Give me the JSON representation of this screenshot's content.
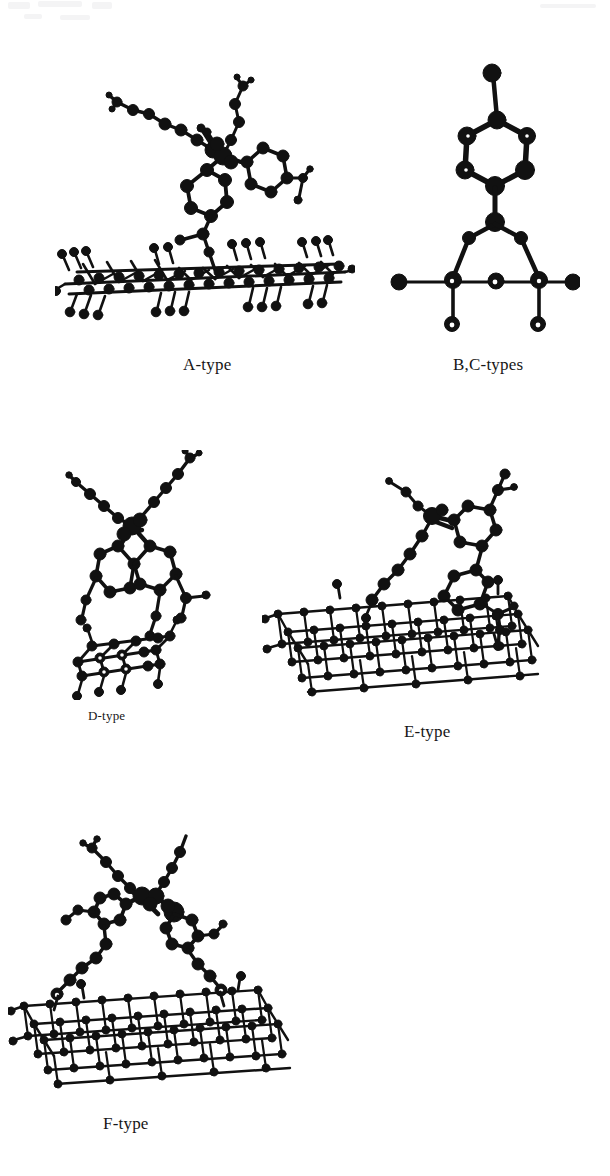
{
  "page": {
    "background": "#ffffff",
    "width": 610,
    "height": 1176,
    "kind": "scientific-figure-scan",
    "ink_color": "#111111"
  },
  "panels": [
    {
      "id": "A",
      "caption": "A-type",
      "description": "Ball-and-stick model: aromatic multi-ring molecule anchored by a short linker onto a nearly edge-on flat slab surface terminated with hydrogen atoms.",
      "surface": "flat slab, edge-on view",
      "molecule_rings": 3,
      "caption_font_size_px": 17
    },
    {
      "id": "B,C",
      "caption": "B,C-types",
      "description": "Symmetric side view: single benzene ring with an axial substituent above a triangular bridging adsorption site on a linear surface row.",
      "surface": "single surface row, bridge site",
      "molecule_rings": 1,
      "caption_font_size_px": 17
    },
    {
      "id": "D",
      "caption": "D-type",
      "description": "Two fused aromatic rings bridging down onto a small surface cluster with hydrogen terminations.",
      "surface": "small cluster",
      "molecule_rings": 2,
      "caption_font_size_px": 13
    },
    {
      "id": "E",
      "caption": "E-type",
      "description": "Tilted cubic crystalline slab with a bicyclic aromatic molecule and a linear alkyl chain positioned above it.",
      "surface": "tilted cubic lattice slab",
      "molecule_rings": 2,
      "caption_font_size_px": 17
    },
    {
      "id": "F",
      "caption": "F-type",
      "description": "Tilted cubic crystalline slab with an X-shaped crossed pair of aromatic chains bridging two surface anchor points.",
      "surface": "tilted cubic lattice slab",
      "molecule_rings": 2,
      "caption_font_size_px": 17
    }
  ],
  "legend": {
    "atom_style": "filled spheres",
    "bond_style": "solid rods"
  }
}
